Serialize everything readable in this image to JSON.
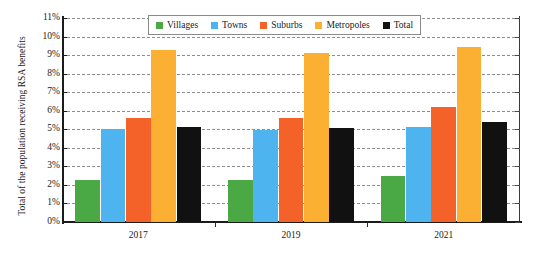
{
  "chart_data": {
    "type": "bar",
    "title": "",
    "subtitle": "",
    "xlabel": "",
    "ylabel": "Total of the population receiving RSA benefits",
    "categories": [
      "2017",
      "2019",
      "2021"
    ],
    "series": [
      {
        "name": "Villages",
        "color": "#4aa845",
        "values": [
          2.25,
          2.25,
          2.5
        ]
      },
      {
        "name": "Towns",
        "color": "#4db4ef",
        "values": [
          5.0,
          4.95,
          5.15
        ]
      },
      {
        "name": "Suburbs",
        "color": "#f4622a",
        "values": [
          5.6,
          5.6,
          6.2
        ]
      },
      {
        "name": "Metropoles",
        "color": "#fbb034",
        "values": [
          9.3,
          9.1,
          9.45
        ]
      },
      {
        "name": "Total",
        "color": "#111111",
        "values": [
          5.15,
          5.05,
          5.4
        ]
      }
    ],
    "ylim": [
      0,
      11
    ],
    "ytick_step": 1,
    "ytick_labels": [
      "0%",
      "1%",
      "2%",
      "3%",
      "4%",
      "5%",
      "6%",
      "7%",
      "8%",
      "9%",
      "10%",
      "11%"
    ],
    "value_unit": "%",
    "grid": true,
    "grid_axis": "y",
    "grid_style": "dashed",
    "grid_color": "#8d8d93",
    "legend_position": "top-center-inside",
    "legend_entries": [
      "Villages",
      "Towns",
      "Suburbs",
      "Metropoles",
      "Total"
    ],
    "axis_color": "#1b1b1b",
    "background_color": "#ffffff"
  }
}
